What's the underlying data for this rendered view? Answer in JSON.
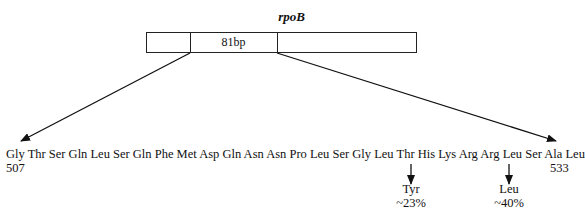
{
  "gene": {
    "name": "rpoB",
    "region_label": "81bp"
  },
  "sequence": {
    "residues": [
      "Gly",
      "Thr",
      "Ser",
      "Gln",
      "Leu",
      "Ser",
      "Gln",
      "Phe",
      "Met",
      "Asp",
      "Gln",
      "Asn",
      "Asn",
      "Pro",
      "Leu",
      "Ser",
      "Gly",
      "Leu",
      "Thr",
      "His",
      "Lys",
      "Arg",
      "Arg",
      "Leu",
      "Ser",
      "Ala",
      "Leu"
    ],
    "text": "Gly Thr Ser Gln Leu Ser Gln Phe Met Asp Gln Asn Asn Pro Leu Ser Gly Leu Thr His Lys Arg Arg Leu Ser Ala Leu",
    "start_position": "507",
    "end_position": "533"
  },
  "mutations": [
    {
      "from": "His",
      "to": "Tyr",
      "frequency": "~23%"
    },
    {
      "from": "Ser",
      "to": "Leu",
      "frequency": "~40%"
    }
  ]
}
